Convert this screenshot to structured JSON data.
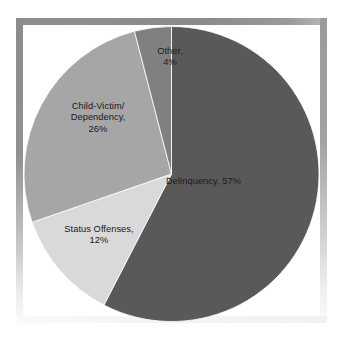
{
  "figure": {
    "background_color": "#ffffff",
    "frame_color": "#8c8c8c"
  },
  "chart_data": {
    "type": "pie",
    "title": "",
    "subtitle": "",
    "xlabel": "",
    "ylabel": "",
    "legend_position": "none",
    "grid": false,
    "start_angle_deg": 90,
    "direction": "clockwise",
    "categories": [
      "Delinquency",
      "Status Offenses",
      "Child-Victim/Dependency",
      "Other"
    ],
    "values": [
      57,
      12,
      26,
      4
    ],
    "value_unit": "%",
    "colors": [
      "#595959",
      "#d9d9d9",
      "#a6a6a6",
      "#808080"
    ],
    "slices": [
      {
        "name": "Delinquency",
        "value": 57,
        "color": "#595959",
        "label_lines": [
          "Delinquency, 57%"
        ]
      },
      {
        "name": "Status Offenses",
        "value": 12,
        "color": "#d9d9d9",
        "label_lines": [
          "Status Offenses,",
          "12%"
        ]
      },
      {
        "name": "Child-Victim/Dependency",
        "value": 26,
        "color": "#a6a6a6",
        "label_lines": [
          "Child-Victim/",
          "Dependency,",
          "26%"
        ]
      },
      {
        "name": "Other",
        "value": 4,
        "color": "#808080",
        "label_lines": [
          "Other,",
          "4%"
        ]
      }
    ]
  },
  "labels": {
    "delinquency": {
      "line1": "Delinquency, 57%"
    },
    "status_offenses": {
      "line1": "Status Offenses,",
      "line2": "12%"
    },
    "child_victim": {
      "line1": "Child-Victim/",
      "line2": "Dependency,",
      "line3": "26%"
    },
    "other": {
      "line1": "Other,",
      "line2": "4%"
    }
  }
}
